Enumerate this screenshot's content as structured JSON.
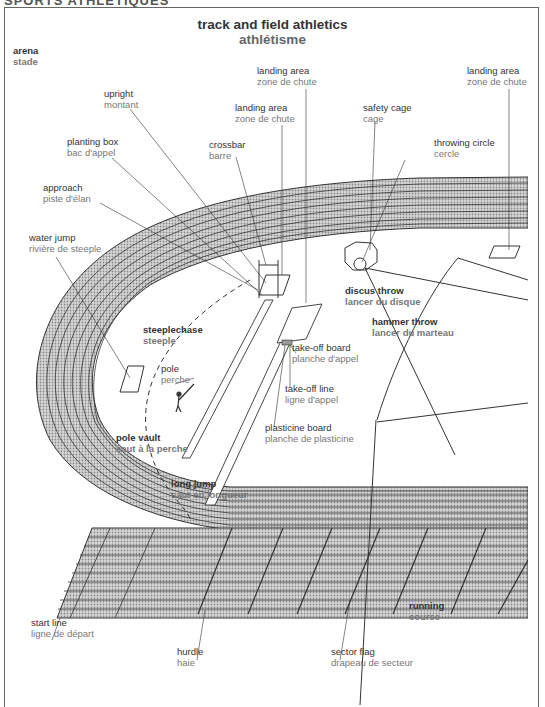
{
  "header": {
    "section": "SPORTS ATHLÉTIQUES",
    "title_en": "track and field athletics",
    "title_fr": "athlétisme"
  },
  "labels": {
    "arena": {
      "en": "arena",
      "fr": "stade"
    },
    "upright": {
      "en": "upright",
      "fr": "montant"
    },
    "landing_area_1": {
      "en": "landing area",
      "fr": "zone de chute"
    },
    "landing_area_2": {
      "en": "landing area",
      "fr": "zone de chute"
    },
    "landing_area_3": {
      "en": "landing area",
      "fr": "zone de chute"
    },
    "planting_box": {
      "en": "planting box",
      "fr": "bac d'appel"
    },
    "crossbar": {
      "en": "crossbar",
      "fr": "barre"
    },
    "safety_cage": {
      "en": "safety cage",
      "fr": "cage"
    },
    "throwing_circle": {
      "en": "throwing circle",
      "fr": "cercle"
    },
    "approach": {
      "en": "approach",
      "fr": "piste d'élan"
    },
    "water_jump": {
      "en": "water jump",
      "fr": "rivière de steeple"
    },
    "discus_throw": {
      "en": "discus throw",
      "fr": "lancer du disque"
    },
    "hammer_throw": {
      "en": "hammer throw",
      "fr": "lancer du marteau"
    },
    "steeplechase": {
      "en": "steeplechase",
      "fr": "steeple"
    },
    "pole": {
      "en": "pole",
      "fr": "perche"
    },
    "take_off_board": {
      "en": "take-off board",
      "fr": "planche d'appel"
    },
    "take_off_line": {
      "en": "take-off line",
      "fr": "ligne d'appel"
    },
    "plasticine_board": {
      "en": "plasticine board",
      "fr": "planche de plasticine"
    },
    "pole_vault": {
      "en": "pole vault",
      "fr": "saut à la perche"
    },
    "long_jump": {
      "en": "long jump",
      "fr": "saut en longueur"
    },
    "running": {
      "en": "running",
      "fr": "course"
    },
    "start_line": {
      "en": "start line",
      "fr": "ligne de départ"
    },
    "hurdle": {
      "en": "hurdle",
      "fr": "haie"
    },
    "sector_flag": {
      "en": "sector flag",
      "fr": "drapeau de secteur"
    }
  },
  "colors": {
    "ink": "#333333",
    "ink_light": "#777777",
    "track_fill": "#bdbdbd",
    "frame": "#666666"
  }
}
